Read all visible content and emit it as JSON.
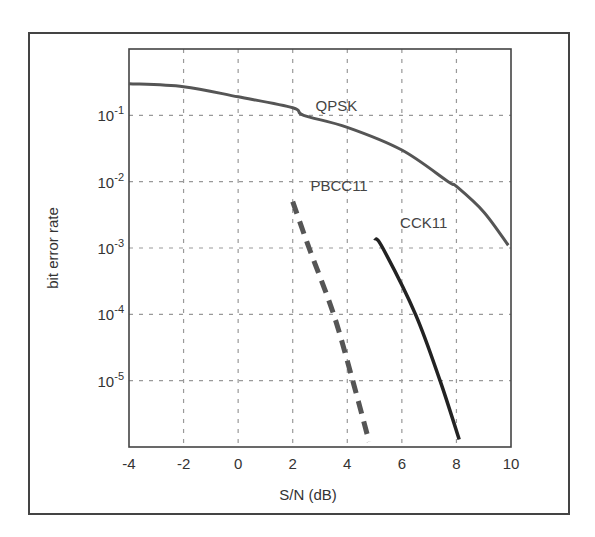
{
  "chart_data": {
    "type": "line",
    "title": "",
    "xlabel": "S/N (dB)",
    "ylabel": "bit error rate",
    "xlim": [
      -4,
      10
    ],
    "ylim": [
      1e-06,
      1
    ],
    "yscale": "log",
    "grid": true,
    "legend": "inline labels",
    "x_ticks": [
      -4,
      -2,
      0,
      2,
      4,
      6,
      8,
      10
    ],
    "x_tick_labels": [
      "-4",
      "-2",
      "0",
      "2",
      "4",
      "6",
      "8",
      "10"
    ],
    "y_ticks": [
      0.1,
      0.01,
      0.001,
      0.0001,
      1e-05
    ],
    "y_tick_labels": [
      {
        "base": "10",
        "exp": "-1"
      },
      {
        "base": "10",
        "exp": "-2"
      },
      {
        "base": "10",
        "exp": "-3"
      },
      {
        "base": "10",
        "exp": "-4"
      },
      {
        "base": "10",
        "exp": "-5"
      }
    ],
    "series": [
      {
        "name": "QPSK",
        "style": "solid",
        "color": "#555555",
        "width": 3,
        "label_pos": {
          "x": 3.6,
          "y": 0.14
        },
        "x": [
          -4,
          -2,
          0,
          2,
          2.4,
          4,
          6,
          7.7,
          8,
          9,
          9.9
        ],
        "y": [
          0.3,
          0.27,
          0.19,
          0.13,
          0.1,
          0.066,
          0.03,
          0.01,
          0.0085,
          0.0035,
          0.0011
        ]
      },
      {
        "name": "PBCC11",
        "style": "dashed",
        "color": "#555555",
        "width": 5,
        "label_pos": {
          "x": 3.7,
          "y": 0.0085
        },
        "x": [
          2.0,
          2.6,
          3.5,
          4.2,
          4.8
        ],
        "y": [
          0.005,
          0.001,
          0.0001,
          1e-05,
          1.2e-06
        ]
      },
      {
        "name": "CCK11",
        "style": "solid",
        "color": "#222222",
        "width": 3.5,
        "label_pos": {
          "x": 6.8,
          "y": 0.0024
        },
        "x": [
          5.0,
          5.3,
          6.5,
          7.4,
          8.1
        ],
        "y": [
          0.0014,
          0.001,
          0.0001,
          1e-05,
          1.3e-06
        ]
      }
    ]
  },
  "colors": {
    "frame": "#444444",
    "grid": "#999999",
    "background": "#ffffff"
  }
}
